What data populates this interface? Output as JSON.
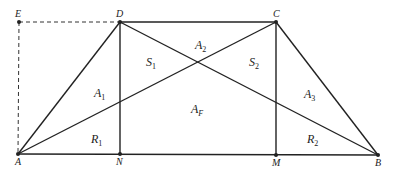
{
  "diagram": {
    "type": "trapezoid-area-decomposition",
    "colors": {
      "line": "#222222",
      "dashed": "#333333",
      "background": "#ffffff"
    },
    "points": {
      "A": {
        "label": "A",
        "x": 18,
        "y": 154
      },
      "B": {
        "label": "B",
        "x": 378,
        "y": 155
      },
      "C": {
        "label": "C",
        "x": 276,
        "y": 22
      },
      "D": {
        "label": "D",
        "x": 120,
        "y": 22
      },
      "E": {
        "label": "E",
        "x": 19,
        "y": 22
      },
      "N": {
        "label": "N",
        "x": 120,
        "y": 154
      },
      "M": {
        "label": "M",
        "x": 276,
        "y": 155
      }
    },
    "regions": [
      {
        "id": "A1",
        "main": "A",
        "sub": "1",
        "x": 94,
        "y": 97
      },
      {
        "id": "A2",
        "main": "A",
        "sub": "2",
        "x": 195,
        "y": 49
      },
      {
        "id": "A3",
        "main": "A",
        "sub": "3",
        "x": 304,
        "y": 98
      },
      {
        "id": "S1",
        "main": "S",
        "sub": "1",
        "x": 146,
        "y": 66
      },
      {
        "id": "S2",
        "main": "S",
        "sub": "2",
        "x": 249,
        "y": 66
      },
      {
        "id": "AF",
        "main": "A",
        "sub": "F",
        "x": 191,
        "y": 113
      },
      {
        "id": "R1",
        "main": "R",
        "sub": "1",
        "x": 91,
        "y": 143
      },
      {
        "id": "R2",
        "main": "R",
        "sub": "2",
        "x": 307,
        "y": 143
      }
    ]
  }
}
